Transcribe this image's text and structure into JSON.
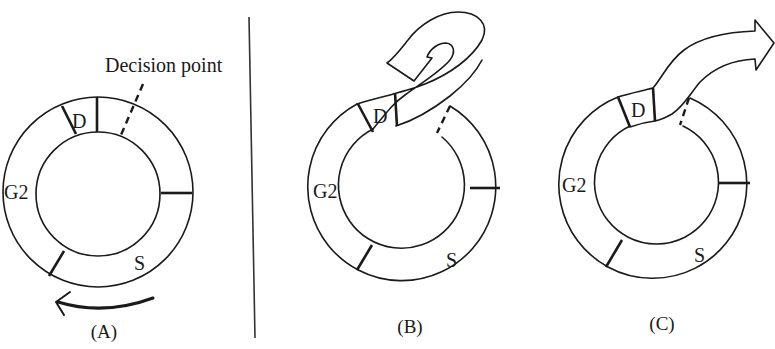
{
  "figure": {
    "annotation": "Decision point",
    "panels": [
      {
        "id": "A",
        "caption": "(A)",
        "phase_labels": {
          "division": "D",
          "g2": "G2",
          "s": "S"
        },
        "outcome": "continue cycle",
        "has_direction_arrow": true
      },
      {
        "id": "B",
        "caption": "(B)",
        "phase_labels": {
          "division": "D",
          "g2": "G2",
          "s": "S"
        },
        "outcome": "exit and re-enter (curled arrow)"
      },
      {
        "id": "C",
        "caption": "(C)",
        "phase_labels": {
          "division": "D",
          "g2": "G2",
          "s": "S"
        },
        "outcome": "exit cycle (straight arrow)"
      }
    ],
    "colors": {
      "ink": "#1a1a1a",
      "background": "#ffffff"
    }
  }
}
